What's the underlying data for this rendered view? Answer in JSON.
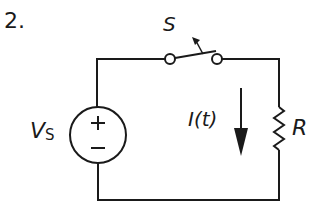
{
  "problem": {
    "number": "2."
  },
  "circuit": {
    "switch": {
      "label": "S",
      "state": "open"
    },
    "source": {
      "label": "V",
      "subscript": "S",
      "plus": "+",
      "minus": "−"
    },
    "current": {
      "label": "I(t)",
      "direction": "down"
    },
    "resistor": {
      "label": "R"
    },
    "stroke_color": "#1a1a1a"
  }
}
